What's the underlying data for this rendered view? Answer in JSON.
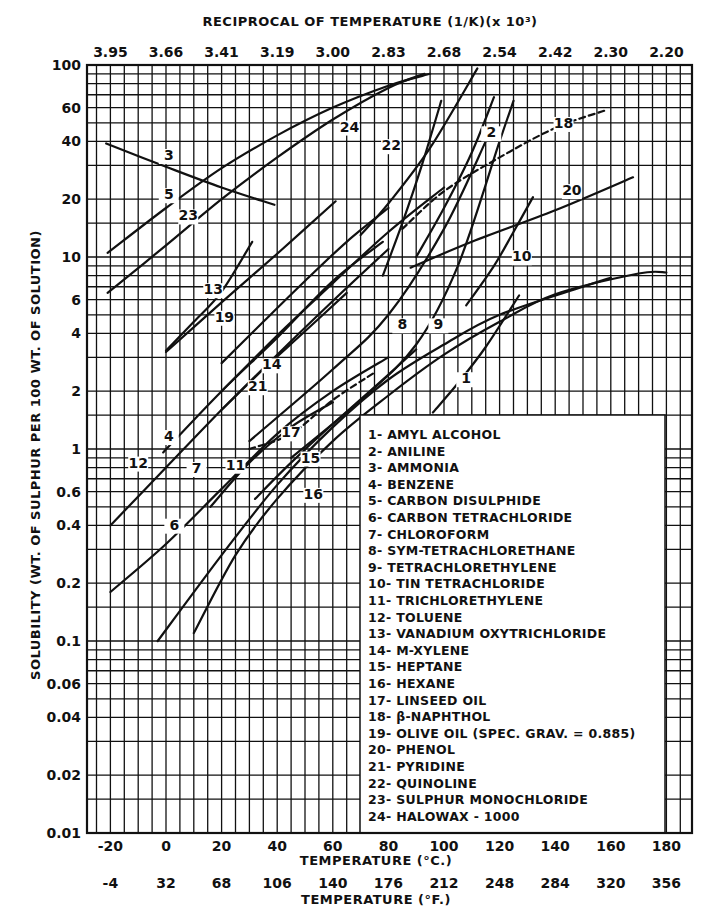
{
  "chart_data": {
    "type": "line",
    "top_axis": {
      "label": "RECIPROCAL OF TEMPERATURE (1/K)(x 10³)",
      "ticks": [
        {
          "c": -20,
          "label": "3.95"
        },
        {
          "c": 0,
          "label": "3.66"
        },
        {
          "c": 20,
          "label": "3.41"
        },
        {
          "c": 40,
          "label": "3.19"
        },
        {
          "c": 60,
          "label": "3.00"
        },
        {
          "c": 80,
          "label": "2.83"
        },
        {
          "c": 100,
          "label": "2.68"
        },
        {
          "c": 120,
          "label": "2.54"
        },
        {
          "c": 140,
          "label": "2.42"
        },
        {
          "c": 160,
          "label": "2.30"
        },
        {
          "c": 180,
          "label": "2.20"
        }
      ]
    },
    "xlabel": "TEMPERATURE (°C.)",
    "xlabel2": "TEMPERATURE (°F.)",
    "ylabel": "SOLUBILITY (WT. OF SULPHUR PER 100 WT. OF SOLUTION)",
    "x_ticks_c": [
      -20,
      0,
      20,
      40,
      60,
      80,
      100,
      120,
      140,
      160,
      180
    ],
    "x_ticks_f": [
      "-4",
      "32",
      "68",
      "106",
      "140",
      "176",
      "212",
      "248",
      "284",
      "320",
      "356"
    ],
    "y_ticks": [
      {
        "v": 100,
        "label": "100"
      },
      {
        "v": 60,
        "label": "60"
      },
      {
        "v": 40,
        "label": "40"
      },
      {
        "v": 20,
        "label": "20"
      },
      {
        "v": 10,
        "label": "10"
      },
      {
        "v": 6,
        "label": "6"
      },
      {
        "v": 4,
        "label": "4"
      },
      {
        "v": 2,
        "label": "2"
      },
      {
        "v": 1,
        "label": "1"
      },
      {
        "v": 0.6,
        "label": "0.6"
      },
      {
        "v": 0.4,
        "label": "0.4"
      },
      {
        "v": 0.2,
        "label": "0.2"
      },
      {
        "v": 0.1,
        "label": "0.1"
      },
      {
        "v": 0.06,
        "label": "0.06"
      },
      {
        "v": 0.04,
        "label": "0.04"
      },
      {
        "v": 0.02,
        "label": "0.02"
      },
      {
        "v": 0.01,
        "label": "0.01"
      }
    ],
    "xlim": [
      -28,
      190
    ],
    "ylim": [
      0.01,
      100
    ],
    "yscale": "log",
    "grid": true,
    "legend_position": "lower-right inset",
    "series": [
      {
        "id": 1,
        "name": "AMYL ALCOHOL",
        "points": [
          [
            96,
            1.55
          ],
          [
            105,
            2.2
          ],
          [
            115,
            3.4
          ],
          [
            127,
            6.3
          ]
        ],
        "label_at": [
          108,
          2.2
        ]
      },
      {
        "id": 2,
        "name": "ANILINE",
        "points": [
          [
            90,
            10
          ],
          [
            100,
            18
          ],
          [
            110,
            35
          ],
          [
            118,
            68
          ]
        ],
        "label_at": [
          117,
          42
        ]
      },
      {
        "id": 3,
        "name": "AMMONIA",
        "points": [
          [
            -21.5,
            39
          ],
          [
            0,
            29.5
          ],
          [
            20,
            23
          ],
          [
            39,
            18.7
          ]
        ],
        "label_at": [
          1,
          32
        ]
      },
      {
        "id": 4,
        "name": "BENZENE",
        "points": [
          [
            -1,
            0.96
          ],
          [
            20,
            2.0
          ],
          [
            40,
            3.8
          ],
          [
            60,
            7.5
          ],
          [
            78,
            12
          ]
        ],
        "label_at": [
          1,
          1.1
        ]
      },
      {
        "id": 5,
        "name": "CARBON DISULPHIDE",
        "points": [
          [
            -21,
            10.5
          ],
          [
            0,
            18
          ],
          [
            20,
            29
          ],
          [
            40,
            43
          ],
          [
            60,
            60
          ],
          [
            80,
            78
          ],
          [
            95,
            90
          ]
        ],
        "label_at": [
          1,
          20
        ]
      },
      {
        "id": 6,
        "name": "CARBON TETRACHLORIDE",
        "points": [
          [
            -20,
            0.18
          ],
          [
            0,
            0.32
          ],
          [
            20,
            0.62
          ],
          [
            40,
            1.2
          ],
          [
            60,
            2.0
          ],
          [
            80,
            3.0
          ]
        ],
        "label_at": [
          3,
          0.38
        ]
      },
      {
        "id": 7,
        "name": "CHLOROFORM",
        "points": [
          [
            16,
            0.5
          ],
          [
            30,
            0.85
          ],
          [
            45,
            1.3
          ],
          [
            60,
            1.75
          ]
        ],
        "label_at": [
          11,
          0.75
        ]
      },
      {
        "id": 8,
        "name": "SYM-TETRACHLORETHANE",
        "points": [
          [
            30,
            1.1
          ],
          [
            60,
            2.6
          ],
          [
            80,
            5.0
          ],
          [
            100,
            14
          ],
          [
            115,
            40
          ]
        ],
        "label_at": [
          85,
          4.2
        ]
      },
      {
        "id": 9,
        "name": "TETRACHLORETHYLENE",
        "points": [
          [
            45,
            0.9
          ],
          [
            70,
            1.8
          ],
          [
            90,
            3.5
          ],
          [
            105,
            9
          ],
          [
            120,
            40
          ],
          [
            125,
            65
          ]
        ],
        "label_at": [
          98,
          4.2
        ]
      },
      {
        "id": 10,
        "name": "TIN TETRACHLORIDE",
        "points": [
          [
            108,
            5.6
          ],
          [
            118,
            9
          ],
          [
            125,
            13.5
          ],
          [
            132,
            20.5
          ]
        ],
        "label_at": [
          128,
          9.5
        ]
      },
      {
        "id": 11,
        "name": "TRICHLORETHYLENE",
        "points": [
          [
            32,
            0.55
          ],
          [
            45,
            0.85
          ],
          [
            60,
            1.35
          ],
          [
            75,
            2.1
          ],
          [
            90,
            3.3
          ]
        ],
        "label_at": [
          25,
          0.78
        ]
      },
      {
        "id": 12,
        "name": "TOLUENE",
        "points": [
          [
            -20,
            0.4
          ],
          [
            0,
            0.8
          ],
          [
            20,
            1.6
          ],
          [
            40,
            3.1
          ],
          [
            60,
            5.9
          ],
          [
            80,
            11
          ]
        ],
        "label_at": [
          -10,
          0.8
        ]
      },
      {
        "id": 13,
        "name": "VANADIUM OXYTRICHLORIDE",
        "points": [
          [
            0,
            3.2
          ],
          [
            20,
            5.8
          ],
          [
            40,
            10.4
          ],
          [
            61,
            19.5
          ]
        ],
        "label_at": [
          17,
          6.4
        ]
      },
      {
        "id": 14,
        "name": "M-XYLENE",
        "points": [
          [
            20,
            2.0
          ],
          [
            40,
            3.9
          ],
          [
            60,
            7.3
          ],
          [
            80,
            13.5
          ],
          [
            100,
            23
          ]
        ],
        "label_at": [
          38,
          2.6
        ]
      },
      {
        "id": 15,
        "name": "HEPTANE",
        "points": [
          [
            -3,
            0.1
          ],
          [
            20,
            0.28
          ],
          [
            40,
            0.65
          ],
          [
            60,
            1.3
          ],
          [
            80,
            2.3
          ],
          [
            100,
            3.5
          ],
          [
            120,
            5.0
          ],
          [
            150,
            7.0
          ],
          [
            160,
            7.8
          ]
        ],
        "label_at": [
          52,
          0.85
        ]
      },
      {
        "id": 16,
        "name": "HEXANE",
        "points": [
          [
            10,
            0.11
          ],
          [
            25,
            0.28
          ],
          [
            40,
            0.55
          ],
          [
            60,
            1.1
          ],
          [
            80,
            1.9
          ],
          [
            100,
            3.1
          ],
          [
            120,
            4.6
          ],
          [
            140,
            6.4
          ],
          [
            170,
            8.2
          ],
          [
            180,
            8.3
          ]
        ],
        "label_at": [
          53,
          0.55
        ]
      },
      {
        "id": 17,
        "name": "LINSEED OIL",
        "points": [
          [
            30,
            1.0
          ],
          [
            45,
            1.2
          ],
          [
            60,
            1.8
          ],
          [
            75,
            2.5
          ]
        ],
        "dashed": true,
        "label_at": [
          45,
          1.15
        ]
      },
      {
        "id": 18,
        "name": "β-NAPHTHOL",
        "points": [
          [
            85,
            14
          ],
          [
            100,
            22
          ],
          [
            120,
            33
          ],
          [
            140,
            47
          ],
          [
            158,
            58
          ]
        ],
        "dashed": true,
        "label_at": [
          143,
          47
        ]
      },
      {
        "id": 19,
        "name": "OLIVE OIL (SPEC. GRAV. = 0.885)",
        "points": [
          [
            20,
            2.8
          ],
          [
            35,
            4.6
          ],
          [
            50,
            7.5
          ],
          [
            65,
            12
          ],
          [
            80,
            18
          ]
        ],
        "label_at": [
          21,
          4.6
        ]
      },
      {
        "id": 20,
        "name": "PHENOL",
        "points": [
          [
            88,
            8.8
          ],
          [
            110,
            12
          ],
          [
            140,
            17.5
          ],
          [
            168,
            26
          ]
        ],
        "label_at": [
          146,
          21
        ]
      },
      {
        "id": 21,
        "name": "PYRIDINE",
        "points": [
          [
            20,
            1.6
          ],
          [
            35,
            2.6
          ],
          [
            50,
            4.1
          ],
          [
            65,
            6.5
          ]
        ],
        "label_at": [
          33,
          2.0
        ]
      },
      {
        "id": 22,
        "name": "QUINOLINE",
        "points": [
          [
            78,
            8
          ],
          [
            85,
            15
          ],
          [
            92,
            30
          ],
          [
            99,
            65
          ]
        ],
        "label_at": [
          81,
          36
        ]
      },
      {
        "id": 23,
        "name": "SULPHUR MONOCHLORIDE",
        "points": [
          [
            -21,
            6.5
          ],
          [
            0,
            11.5
          ],
          [
            20,
            20
          ],
          [
            40,
            33
          ],
          [
            60,
            52
          ],
          [
            80,
            76
          ],
          [
            93,
            90
          ]
        ],
        "label_at": [
          8,
          15.5
        ]
      },
      {
        "id": 24,
        "name": "HALOWAX - 1000",
        "points": [
          [
            70,
            13
          ],
          [
            80,
            19
          ],
          [
            95,
            37
          ],
          [
            112,
            96
          ]
        ],
        "label_at": [
          66,
          45
        ]
      }
    ],
    "extra_segments": [
      {
        "id": "19b",
        "points": [
          [
            0,
            3.25
          ],
          [
            10,
            4.6
          ],
          [
            20,
            6.6
          ],
          [
            31,
            12
          ]
        ]
      }
    ]
  },
  "legend": {
    "items": [
      "1- AMYL ALCOHOL",
      "2- ANILINE",
      "3- AMMONIA",
      "4- BENZENE",
      "5- CARBON DISULPHIDE",
      "6- CARBON TETRACHLORIDE",
      "7- CHLOROFORM",
      "8- SYM-TETRACHLORETHANE",
      "9- TETRACHLORETHYLENE",
      "10- TIN TETRACHLORIDE",
      "11- TRICHLORETHYLENE",
      "12- TOLUENE",
      "13- VANADIUM OXYTRICHLORIDE",
      "14- M-XYLENE",
      "15- HEPTANE",
      "16- HEXANE",
      "17- LINSEED OIL",
      "18- β-NAPHTHOL",
      "19- OLIVE OIL (SPEC. GRAV. = 0.885)",
      "20- PHENOL",
      "21- PYRIDINE",
      "22- QUINOLINE",
      "23- SULPHUR MONOCHLORIDE",
      "24- HALOWAX - 1000"
    ]
  },
  "layout": {
    "plot": {
      "left": 87,
      "right": 692,
      "top": 65,
      "bottom": 833
    },
    "ink_color": "#111111",
    "paper_color": "#ffffff"
  }
}
